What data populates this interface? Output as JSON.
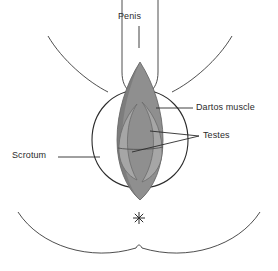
{
  "figure": {
    "type": "anatomical-line-diagram",
    "background_color": "#ffffff",
    "line_color": "#2b2b2b",
    "text_color": "#2b2b2b"
  },
  "labels": {
    "penis": "Penis",
    "dartos_muscle": "Dartos muscle",
    "testes": "Testes",
    "scrotum": "Scrotum"
  },
  "structures": {
    "dartos_muscle_fill": "#8f8f8f",
    "dartos_muscle_shadow": "#6f6f6f",
    "testis_fill": "#a6a6a6",
    "testis_shadow": "#8a8a8a",
    "scrotum_fill": "#ffffff",
    "penis_fill": "#ffffff",
    "anus_marker": "asterisk"
  }
}
